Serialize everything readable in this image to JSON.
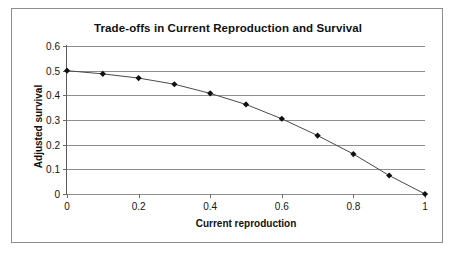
{
  "chart_data": {
    "type": "line",
    "title": "Trade-offs in Current Reproduction and Survival",
    "xlabel": "Current reproduction",
    "ylabel": "Adjusted survival",
    "xlim": [
      0,
      1
    ],
    "ylim": [
      0,
      0.6
    ],
    "grid": "horizontal",
    "legend": "none",
    "marker": "diamond",
    "xticks": [
      "0",
      "0.2",
      "0.4",
      "0.6",
      "0.8",
      "1"
    ],
    "xtick_values": [
      0,
      0.2,
      0.4,
      0.6,
      0.8,
      1
    ],
    "yticks": [
      "0",
      "0.1",
      "0.2",
      "0.3",
      "0.4",
      "0.5",
      "0.6"
    ],
    "ytick_values": [
      0,
      0.1,
      0.2,
      0.3,
      0.4,
      0.5,
      0.6
    ],
    "x": [
      0,
      0.1,
      0.2,
      0.3,
      0.4,
      0.5,
      0.6,
      0.7,
      0.8,
      0.9,
      1
    ],
    "values": [
      0.5,
      0.487,
      0.47,
      0.445,
      0.408,
      0.363,
      0.305,
      0.237,
      0.162,
      0.075,
      0.0
    ],
    "series": [
      {
        "name": "Adjusted survival",
        "values": [
          0.5,
          0.487,
          0.47,
          0.445,
          0.408,
          0.363,
          0.305,
          0.237,
          0.162,
          0.075,
          0.0
        ]
      }
    ],
    "colors": {
      "line": "#4a4a4a",
      "marker": "#111111",
      "gridline": "#8e8e8e",
      "axis": "#5a5a5a",
      "background": "#ffffff",
      "text": "#111111"
    }
  }
}
